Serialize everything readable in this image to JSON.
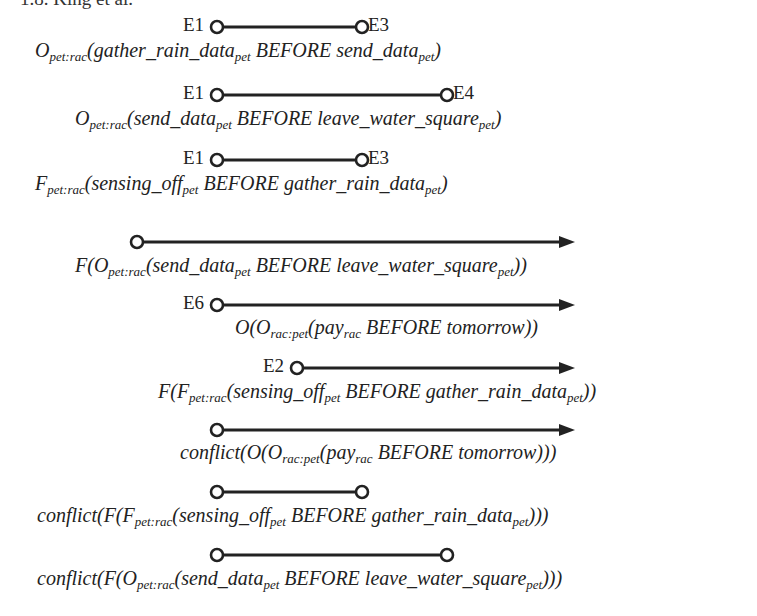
{
  "header": {
    "text": "1.8. King et al."
  },
  "accent": {
    "line": "#222222",
    "circle_fill": "#ffffff"
  },
  "rows": [
    {
      "id": "row1",
      "start_label": "E1",
      "end_label": "E3",
      "kind": "segment",
      "x1": 217,
      "x2": 362,
      "y": 27,
      "formula": {
        "parts": [
          {
            "t": "O"
          },
          {
            "sub": "pet:rac"
          },
          {
            "t": "(gather_rain_data"
          },
          {
            "sub": "pet"
          },
          {
            "t": " BEFORE send_data"
          },
          {
            "sub": "pet"
          },
          {
            "t": ")"
          }
        ],
        "x": 35,
        "y": 40
      }
    },
    {
      "id": "row2",
      "start_label": "E1",
      "end_label": "E4",
      "kind": "segment",
      "x1": 217,
      "x2": 447,
      "y": 95,
      "formula": {
        "parts": [
          {
            "t": "O"
          },
          {
            "sub": "pet:rac"
          },
          {
            "t": "(send_data"
          },
          {
            "sub": "pet"
          },
          {
            "t": " BEFORE leave_water_square"
          },
          {
            "sub": "pet"
          },
          {
            "t": ")"
          }
        ],
        "x": 75,
        "y": 108
      }
    },
    {
      "id": "row3",
      "start_label": "E1",
      "end_label": "E3",
      "kind": "segment",
      "x1": 217,
      "x2": 362,
      "y": 160,
      "formula": {
        "parts": [
          {
            "t": "F"
          },
          {
            "sub": "pet:rac"
          },
          {
            "t": "(sensing_off"
          },
          {
            "sub": "pet"
          },
          {
            "t": " BEFORE gather_rain_data"
          },
          {
            "sub": "pet"
          },
          {
            "t": ")"
          }
        ],
        "x": 35,
        "y": 173
      }
    },
    {
      "id": "row4",
      "start_label": "",
      "end_label": "",
      "kind": "arrow",
      "x1": 137,
      "x2": 575,
      "y": 242,
      "formula": {
        "parts": [
          {
            "t": "F(O"
          },
          {
            "sub": "pet:rac"
          },
          {
            "t": "(send_data"
          },
          {
            "sub": "pet"
          },
          {
            "t": " BEFORE leave_water_square"
          },
          {
            "sub": "pet"
          },
          {
            "t": "))"
          }
        ],
        "x": 75,
        "y": 255
      }
    },
    {
      "id": "row5",
      "start_label": "E6",
      "end_label": "",
      "kind": "arrow",
      "x1": 217,
      "x2": 575,
      "y": 305,
      "formula": {
        "parts": [
          {
            "t": "O(O"
          },
          {
            "sub": "rac:pet"
          },
          {
            "t": "(pay"
          },
          {
            "sub": "rac"
          },
          {
            "t": " BEFORE tomorrow))"
          }
        ],
        "x": 235,
        "y": 317
      }
    },
    {
      "id": "row6",
      "start_label": "E2",
      "end_label": "",
      "kind": "arrow",
      "x1": 297,
      "x2": 575,
      "y": 368,
      "formula": {
        "parts": [
          {
            "t": "F(F"
          },
          {
            "sub": "pet:rac"
          },
          {
            "t": "(sensing_off"
          },
          {
            "sub": "pet"
          },
          {
            "t": " BEFORE gather_rain_data"
          },
          {
            "sub": "pet"
          },
          {
            "t": "))"
          }
        ],
        "x": 158,
        "y": 381
      }
    },
    {
      "id": "row7",
      "start_label": "",
      "end_label": "",
      "kind": "arrow",
      "x1": 217,
      "x2": 575,
      "y": 430,
      "formula": {
        "parts": [
          {
            "t": "conflict(O(O"
          },
          {
            "sub": "rac:pet"
          },
          {
            "t": "(pay"
          },
          {
            "sub": "rac"
          },
          {
            "t": " BEFORE tomorrow)))"
          }
        ],
        "x": 180,
        "y": 442
      }
    },
    {
      "id": "row8",
      "start_label": "",
      "end_label": "",
      "kind": "segment",
      "x1": 217,
      "x2": 362,
      "y": 492,
      "formula": {
        "parts": [
          {
            "t": "conflict(F(F"
          },
          {
            "sub": "pet:rac"
          },
          {
            "t": "(sensing_off"
          },
          {
            "sub": "pet"
          },
          {
            "t": " BEFORE gather_rain_data"
          },
          {
            "sub": "pet"
          },
          {
            "t": ")))"
          }
        ],
        "x": 37,
        "y": 505
      }
    },
    {
      "id": "row9",
      "start_label": "",
      "end_label": "",
      "kind": "segment",
      "x1": 217,
      "x2": 447,
      "y": 555,
      "formula": {
        "parts": [
          {
            "t": "conflict(F(O"
          },
          {
            "sub": "pet:rac"
          },
          {
            "t": "(send_data"
          },
          {
            "sub": "pet"
          },
          {
            "t": " BEFORE leave_water_square"
          },
          {
            "sub": "pet"
          },
          {
            "t": ")))"
          }
        ],
        "x": 37,
        "y": 568
      }
    }
  ]
}
